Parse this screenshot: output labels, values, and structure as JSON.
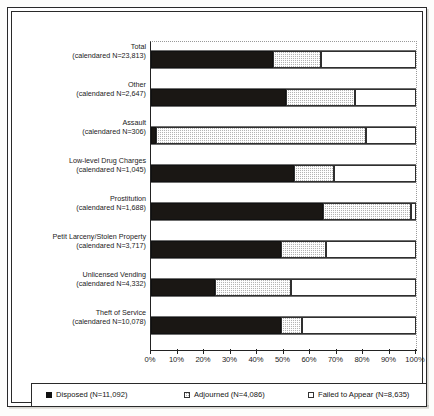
{
  "chart_data": {
    "type": "bar",
    "orientation": "horizontal",
    "stacked": true,
    "stack_mode": "percent",
    "title": "",
    "subtitle": "",
    "xlabel": "",
    "ylabel": "",
    "xlim": [
      0,
      100
    ],
    "grid": true,
    "legend_position": "bottom",
    "tick_labels": [
      "0%",
      "10%",
      "20%",
      "30%",
      "40%",
      "50%",
      "60%",
      "70%",
      "80%",
      "90%",
      "100%"
    ],
    "tick_values": [
      0,
      10,
      20,
      30,
      40,
      50,
      60,
      70,
      80,
      90,
      100
    ],
    "categories": [
      "Total",
      "Other",
      "Assault",
      "Low-level Drug Charges",
      "Prostitution",
      "Petit Larceny/Stolen Property",
      "Unlicensed Vending",
      "Theft of Service"
    ],
    "category_sublabels": [
      "(calendared N=23,813)",
      "(calendared N=2,647)",
      "(calendared N=306)",
      "(calendared N=1,045)",
      "(calendared N=1,688)",
      "(calendared N=3,717)",
      "(calendared N=4,332)",
      "(calendared N=10,078)"
    ],
    "series": [
      {
        "name": "Disposed",
        "legend_label": "Disposed (N=11,092)",
        "n": 11092,
        "color": "#1a1714",
        "values": [
          46,
          51,
          2,
          54,
          65,
          49,
          24,
          49
        ]
      },
      {
        "name": "Adjourned",
        "legend_label": "Adjourned (N=4,086)",
        "n": 4086,
        "color": "#b3b3b3",
        "values": [
          18,
          26,
          79,
          15,
          33,
          17,
          29,
          8
        ]
      },
      {
        "name": "Failed to Appear",
        "legend_label": "Failed to Appear (N=8,635)",
        "n": 8635,
        "color": "#ffffff",
        "values": [
          36,
          23,
          19,
          31,
          2,
          34,
          47,
          43
        ]
      }
    ]
  },
  "legend": {
    "items": [
      {
        "label": "Disposed (N=11,092)",
        "swatch": "disposed"
      },
      {
        "label": "Adjourned (N=4,086)",
        "swatch": "adjourned"
      },
      {
        "label": "Failed to Appear (N=8,635)",
        "swatch": "fta"
      }
    ]
  },
  "axis": {
    "x_labels": [
      "0%",
      "10%",
      "20%",
      "30%",
      "40%",
      "50%",
      "60%",
      "70%",
      "80%",
      "90%",
      "100%"
    ]
  },
  "rows": [
    {
      "name": "Total",
      "sub": "(calendared N=23,813)",
      "disposed": 46,
      "adjourned": 18,
      "fta": 36
    },
    {
      "name": "Other",
      "sub": "(calendared N=2,647)",
      "disposed": 51,
      "adjourned": 26,
      "fta": 23
    },
    {
      "name": "Assault",
      "sub": "(calendared N=306)",
      "disposed": 2,
      "adjourned": 79,
      "fta": 19
    },
    {
      "name": "Low-level Drug Charges",
      "sub": "(calendared N=1,045)",
      "disposed": 54,
      "adjourned": 15,
      "fta": 31
    },
    {
      "name": "Prostitution",
      "sub": "(calendared N=1,688)",
      "disposed": 65,
      "adjourned": 33,
      "fta": 2
    },
    {
      "name": "Petit Larceny/Stolen Property",
      "sub": "(calendared N=3,717)",
      "disposed": 49,
      "adjourned": 17,
      "fta": 34
    },
    {
      "name": "Unlicensed Vending",
      "sub": "(calendared N=4,332)",
      "disposed": 24,
      "adjourned": 29,
      "fta": 47
    },
    {
      "name": "Theft of Service",
      "sub": "(calendared N=10,078)",
      "disposed": 49,
      "adjourned": 8,
      "fta": 43
    }
  ]
}
